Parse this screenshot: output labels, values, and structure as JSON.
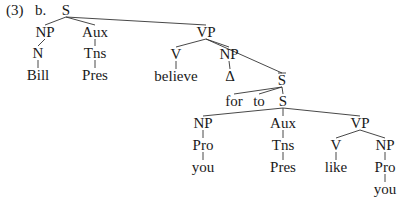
{
  "example": {
    "number": "(3)",
    "sub": "b."
  },
  "colors": {
    "text": "#1a1a1a",
    "line": "#333333",
    "background": "#ffffff"
  },
  "nodes": [
    {
      "id": "S0",
      "label": "S",
      "x": 66,
      "y": 15
    },
    {
      "id": "NP1",
      "label": "NP",
      "x": 45,
      "y": 37
    },
    {
      "id": "Aux1",
      "label": "Aux",
      "x": 95,
      "y": 37
    },
    {
      "id": "N1",
      "label": "N",
      "x": 38,
      "y": 58
    },
    {
      "id": "Tns1",
      "label": "Tns",
      "x": 95,
      "y": 58
    },
    {
      "id": "Bill",
      "label": "Bill",
      "x": 38,
      "y": 80
    },
    {
      "id": "Pres1",
      "label": "Pres",
      "x": 95,
      "y": 80
    },
    {
      "id": "VP1",
      "label": "VP",
      "x": 206,
      "y": 37
    },
    {
      "id": "V1",
      "label": "V",
      "x": 176,
      "y": 59
    },
    {
      "id": "NP2",
      "label": "NP",
      "x": 229,
      "y": 59
    },
    {
      "id": "believe",
      "label": "believe",
      "x": 176,
      "y": 81
    },
    {
      "id": "delta",
      "label": "Δ",
      "x": 230,
      "y": 81
    },
    {
      "id": "Sbar",
      "label": "S",
      "x": 282,
      "y": 85,
      "bar": true
    },
    {
      "id": "for",
      "label": "for",
      "x": 234,
      "y": 106
    },
    {
      "id": "to",
      "label": "to",
      "x": 259,
      "y": 106
    },
    {
      "id": "S2",
      "label": "S",
      "x": 283,
      "y": 106
    },
    {
      "id": "NP3",
      "label": "NP",
      "x": 203,
      "y": 128
    },
    {
      "id": "Aux2",
      "label": "Aux",
      "x": 283,
      "y": 128
    },
    {
      "id": "VP2",
      "label": "VP",
      "x": 360,
      "y": 128
    },
    {
      "id": "Pro1",
      "label": "Pro",
      "x": 203,
      "y": 150
    },
    {
      "id": "Tns2",
      "label": "Tns",
      "x": 283,
      "y": 150
    },
    {
      "id": "V2",
      "label": "V",
      "x": 336,
      "y": 150
    },
    {
      "id": "NP4",
      "label": "NP",
      "x": 385,
      "y": 150
    },
    {
      "id": "you1",
      "label": "you",
      "x": 203,
      "y": 172
    },
    {
      "id": "Pres2",
      "label": "Pres",
      "x": 283,
      "y": 172
    },
    {
      "id": "like",
      "label": "like",
      "x": 336,
      "y": 172
    },
    {
      "id": "Pro2",
      "label": "Pro",
      "x": 385,
      "y": 172
    },
    {
      "id": "you2",
      "label": "you",
      "x": 385,
      "y": 194
    }
  ],
  "edges": [
    [
      "S0",
      "NP1"
    ],
    [
      "S0",
      "Aux1"
    ],
    [
      "S0",
      "VP1"
    ],
    [
      "NP1",
      "N1"
    ],
    [
      "N1",
      "Bill"
    ],
    [
      "Aux1",
      "Tns1"
    ],
    [
      "Tns1",
      "Pres1"
    ],
    [
      "VP1",
      "V1"
    ],
    [
      "VP1",
      "NP2"
    ],
    [
      "VP1",
      "Sbar"
    ],
    [
      "V1",
      "believe"
    ],
    [
      "NP2",
      "delta"
    ],
    [
      "Sbar",
      "for"
    ],
    [
      "Sbar",
      "to"
    ],
    [
      "Sbar",
      "S2"
    ],
    [
      "S2",
      "NP3"
    ],
    [
      "S2",
      "Aux2"
    ],
    [
      "S2",
      "VP2"
    ],
    [
      "NP3",
      "Pro1"
    ],
    [
      "Pro1",
      "you1"
    ],
    [
      "Aux2",
      "Tns2"
    ],
    [
      "Tns2",
      "Pres2"
    ],
    [
      "VP2",
      "V2"
    ],
    [
      "VP2",
      "NP4"
    ],
    [
      "V2",
      "like"
    ],
    [
      "NP4",
      "Pro2"
    ],
    [
      "Pro2",
      "you2"
    ]
  ]
}
